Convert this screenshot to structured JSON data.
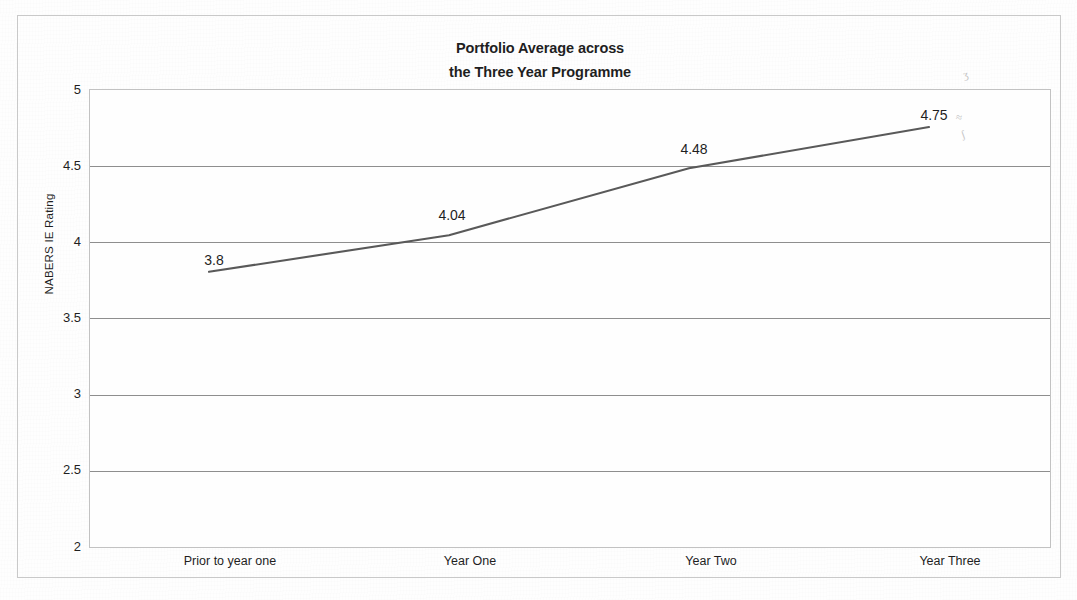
{
  "chart_data": {
    "type": "line",
    "title": "Portfolio Average across the Three Year Programme",
    "title_lines": [
      "Portfolio Average across",
      "the Three Year Programme"
    ],
    "categories": [
      "Prior to year one",
      "Year One",
      "Year Two",
      "Year Three"
    ],
    "values": [
      3.8,
      4.04,
      4.48,
      4.75
    ],
    "point_labels": [
      "3.8",
      "4.04",
      "4.48",
      "4.75"
    ],
    "xlabel": "",
    "ylabel": "NABERS IE Rating",
    "ylim": [
      2,
      5
    ],
    "ytick_step": 0.5,
    "ytick_labels": [
      "5",
      "4.5",
      "4",
      "3.5",
      "3",
      "2.5",
      "2"
    ],
    "ytick_values": [
      5,
      4.5,
      4,
      3.5,
      3,
      2.5,
      2
    ],
    "grid": true,
    "legend": false,
    "legend_position": "none",
    "series": [
      {
        "name": "Portfolio Average",
        "values": [
          3.8,
          4.04,
          4.48,
          4.75
        ],
        "color": "#595959",
        "marker": "none"
      }
    ],
    "colors": {
      "line": "#595959",
      "gridline": "#8e8e8e",
      "plot_border": "#c2c2c2",
      "frame_border": "#c9c9c9",
      "text": "#1f1f1f",
      "background": "#fefefe"
    }
  },
  "artifacts": {
    "smudge_marks": [
      "ʒ",
      "≈",
      "ʃ"
    ]
  }
}
